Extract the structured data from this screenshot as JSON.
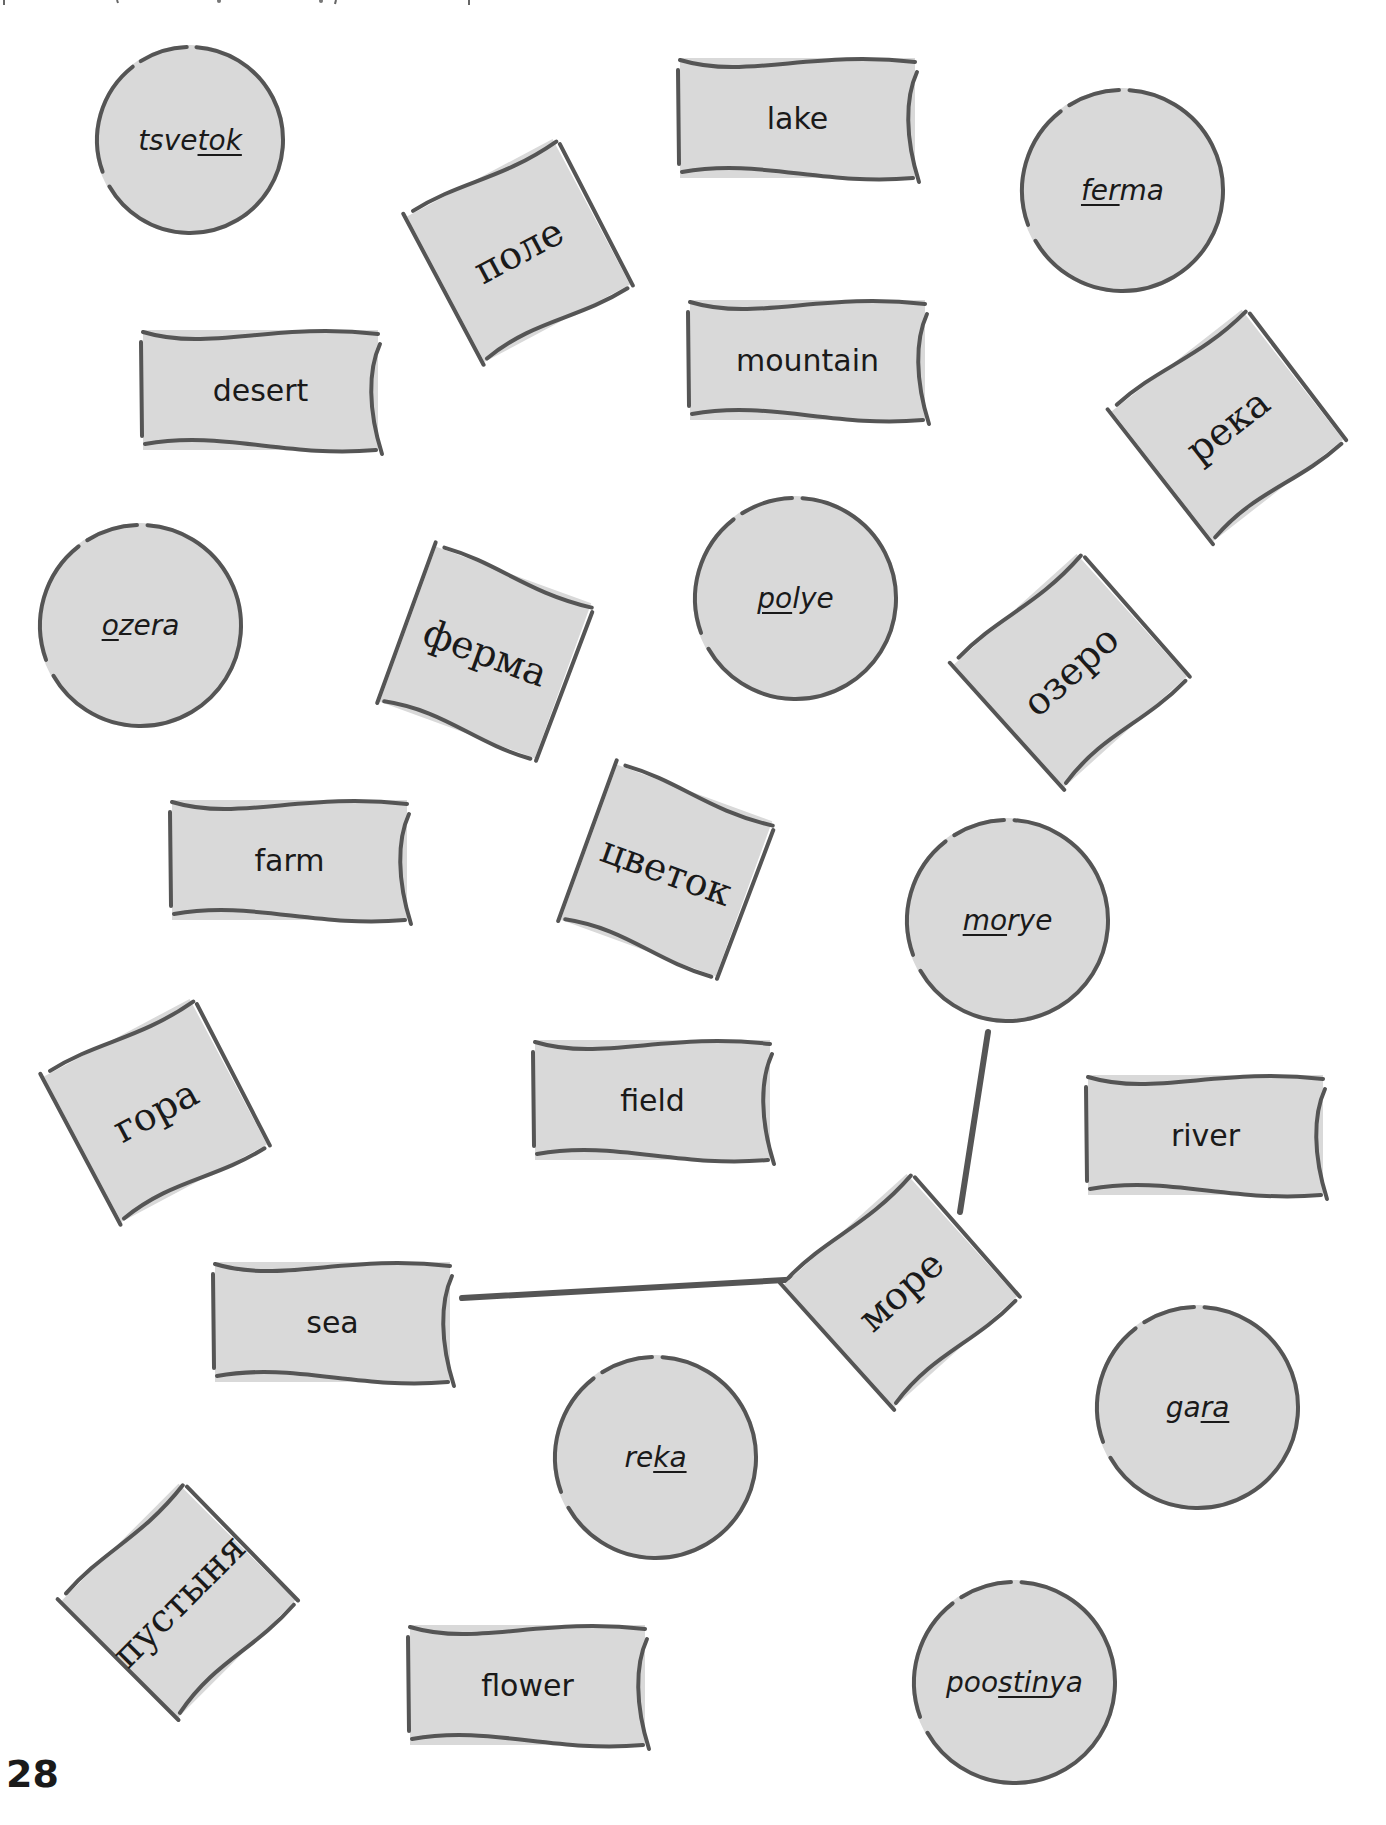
{
  "page": {
    "number": "28",
    "colors": {
      "fill": "#d9d9d9",
      "stroke": "#555555",
      "text": "#1a1a1a",
      "background": "#ffffff"
    }
  },
  "circles": [
    {
      "id": "tsvetok",
      "pre": "tsve",
      "stress": "tok",
      "post": "",
      "x": 95,
      "y": 45,
      "d": 190
    },
    {
      "id": "ferma",
      "pre": "",
      "stress": "fer",
      "post": "ma",
      "x": 1020,
      "y": 88,
      "d": 205
    },
    {
      "id": "ozera",
      "pre": "",
      "stress": "o",
      "post": "zera",
      "x": 38,
      "y": 523,
      "d": 205
    },
    {
      "id": "polye",
      "pre": "",
      "stress": "po",
      "post": "lye",
      "x": 693,
      "y": 496,
      "d": 205
    },
    {
      "id": "morye",
      "pre": "",
      "stress": "mo",
      "post": "rye",
      "x": 905,
      "y": 818,
      "d": 205
    },
    {
      "id": "gara",
      "pre": "ga",
      "stress": "ra",
      "post": "",
      "x": 1095,
      "y": 1305,
      "d": 205
    },
    {
      "id": "reka",
      "pre": "re",
      "stress": "ka",
      "post": "",
      "x": 553,
      "y": 1355,
      "d": 205
    },
    {
      "id": "poostinya",
      "pre": "poo",
      "stress": "stin",
      "post": "ya",
      "x": 912,
      "y": 1580,
      "d": 205
    }
  ],
  "flags": [
    {
      "id": "lake",
      "label": "lake",
      "x": 680,
      "y": 58,
      "w": 235,
      "h": 120
    },
    {
      "id": "desert",
      "label": "desert",
      "x": 143,
      "y": 330,
      "w": 235,
      "h": 120
    },
    {
      "id": "mountain",
      "label": "mountain",
      "x": 690,
      "y": 300,
      "w": 235,
      "h": 120
    },
    {
      "id": "farm",
      "label": "farm",
      "x": 172,
      "y": 800,
      "w": 235,
      "h": 120
    },
    {
      "id": "field",
      "label": "field",
      "x": 535,
      "y": 1040,
      "w": 235,
      "h": 120
    },
    {
      "id": "river",
      "label": "river",
      "x": 1088,
      "y": 1075,
      "w": 235,
      "h": 120
    },
    {
      "id": "sea",
      "label": "sea",
      "x": 215,
      "y": 1262,
      "w": 235,
      "h": 120
    },
    {
      "id": "flower",
      "label": "flower",
      "x": 410,
      "y": 1625,
      "w": 235,
      "h": 120
    }
  ],
  "squares": [
    {
      "id": "pole",
      "label": "поле",
      "cx": 518,
      "cy": 250,
      "size": 165,
      "rotate": -28
    },
    {
      "id": "reka-ru",
      "label": "река",
      "cx": 1227,
      "cy": 425,
      "size": 165,
      "rotate": -38
    },
    {
      "id": "ferma-ru",
      "label": "ферма",
      "cx": 485,
      "cy": 652,
      "size": 165,
      "rotate": 20
    },
    {
      "id": "ozero",
      "label": "озеро",
      "cx": 1070,
      "cy": 670,
      "size": 165,
      "rotate": -42
    },
    {
      "id": "tsvetok-ru",
      "label": "цветок",
      "cx": 666,
      "cy": 870,
      "size": 165,
      "rotate": 20
    },
    {
      "id": "gora",
      "label": "гора",
      "cx": 155,
      "cy": 1110,
      "size": 165,
      "rotate": -28
    },
    {
      "id": "more",
      "label": "море",
      "cx": 900,
      "cy": 1290,
      "size": 165,
      "rotate": -42
    },
    {
      "id": "pustynya",
      "label": "пустыня",
      "cx": 178,
      "cy": 1600,
      "size": 165,
      "rotate": -45
    }
  ],
  "connectors": [
    {
      "from": "morye",
      "to": "more",
      "x1": 988,
      "y1": 1032,
      "x2": 960,
      "y2": 1212
    },
    {
      "from": "sea",
      "to": "more",
      "x1": 462,
      "y1": 1298,
      "x2": 803,
      "y2": 1279
    }
  ]
}
